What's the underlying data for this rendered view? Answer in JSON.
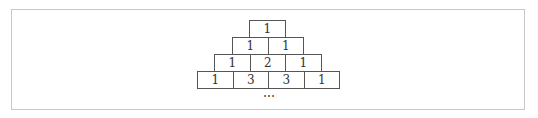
{
  "diagram": {
    "rows": [
      [
        "1"
      ],
      [
        "1",
        "1"
      ],
      [
        "1",
        "2",
        "1"
      ],
      [
        "1",
        "3",
        "3",
        "1"
      ]
    ],
    "continuation": "⋯"
  }
}
